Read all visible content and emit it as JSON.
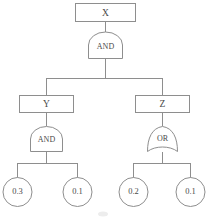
{
  "diagram": {
    "type": "fault-tree",
    "title": "",
    "colors": {
      "stroke": "#8e8e8e",
      "text": "#4a4a4a",
      "background": "#ffffff"
    },
    "nodes": {
      "root_event": {
        "label": "X",
        "shape": "rectangle",
        "cx": 105,
        "cy": 13
      },
      "root_gate": {
        "label": "AND",
        "shape": "and-gate",
        "cx": 105,
        "cy": 45
      },
      "left_event": {
        "label": "Y",
        "shape": "rectangle",
        "cx": 46,
        "cy": 103
      },
      "right_event": {
        "label": "Z",
        "shape": "rectangle",
        "cx": 162,
        "cy": 103
      },
      "left_gate": {
        "label": "AND",
        "shape": "and-gate",
        "cx": 46,
        "cy": 138
      },
      "right_gate": {
        "label": "OR",
        "shape": "or-gate",
        "cx": 162,
        "cy": 138
      },
      "leaf_1": {
        "label": "0.3",
        "shape": "circle",
        "cx": 17,
        "cy": 192
      },
      "leaf_2": {
        "label": "0.1",
        "shape": "circle",
        "cx": 77,
        "cy": 192
      },
      "leaf_3": {
        "label": "0.2",
        "shape": "circle",
        "cx": 133,
        "cy": 192
      },
      "leaf_4": {
        "label": "0.1",
        "shape": "circle",
        "cx": 190,
        "cy": 192
      }
    },
    "edges": [
      {
        "from": "root_event",
        "to": "root_gate"
      },
      {
        "from": "root_gate",
        "to": "left_event"
      },
      {
        "from": "root_gate",
        "to": "right_event"
      },
      {
        "from": "left_event",
        "to": "left_gate"
      },
      {
        "from": "right_event",
        "to": "right_gate"
      },
      {
        "from": "left_gate",
        "to": "leaf_1"
      },
      {
        "from": "left_gate",
        "to": "leaf_2"
      },
      {
        "from": "right_gate",
        "to": "leaf_3"
      },
      {
        "from": "right_gate",
        "to": "leaf_4"
      }
    ]
  }
}
